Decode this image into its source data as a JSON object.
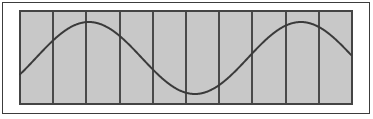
{
  "figure": {
    "background_color": "#ffffff",
    "outer_frame": {
      "name": "outer-frame",
      "x": 2.5,
      "y": 2.5,
      "width": 367,
      "height": 111,
      "stroke_color": "#3c3c3c",
      "stroke_width": 1,
      "fill": "none"
    },
    "panel": {
      "name": "plot-panel",
      "x": 20,
      "y": 11,
      "width": 332,
      "height": 93,
      "fill_color": "#c8c8c8",
      "stroke_color": "#444444",
      "stroke_width": 2
    },
    "grid": {
      "name": "vertical-gridlines",
      "orientation": "vertical",
      "count": 9,
      "columns": 10,
      "spacing": 33.2,
      "stroke_color": "#4a4a4a",
      "stroke_width": 2,
      "x_positions": [
        53.2,
        86.4,
        119.6,
        152.8,
        186.0,
        219.2,
        252.4,
        285.6,
        318.8
      ]
    },
    "curve": {
      "name": "sine-curve",
      "stroke_color": "#3a3a3a",
      "stroke_width": 2,
      "fill": "none",
      "linecap": "round",
      "linejoin": "round"
    }
  },
  "chart_data": {
    "type": "line",
    "xlabel": "",
    "ylabel": "",
    "grid": true,
    "grid_orientation": "vertical",
    "grid_lines": 9,
    "legend": "none",
    "xlim": [
      20,
      352
    ],
    "ylim": [
      11,
      104
    ],
    "axis_ticks": [],
    "series": [
      {
        "name": "sine",
        "waveform": "sine",
        "amplitude": 36,
        "centerline_y": 58,
        "period": 212,
        "phase_deg": -27,
        "x_start": 20,
        "x_end": 351,
        "peaks": [
          {
            "x": 76,
            "y": 22
          },
          {
            "x": 288,
            "y": 22
          }
        ],
        "troughs": [
          {
            "x": 182,
            "y": 94
          }
        ],
        "endpoints": [
          {
            "x": 20,
            "y": 59
          },
          {
            "x": 351,
            "y": 63
          }
        ],
        "points": [
          {
            "x": 20,
            "y": 59.1
          },
          {
            "x": 30,
            "y": 49.8
          },
          {
            "x": 40,
            "y": 41.0
          },
          {
            "x": 50,
            "y": 33.5
          },
          {
            "x": 60,
            "y": 27.5
          },
          {
            "x": 70,
            "y": 23.6
          },
          {
            "x": 76,
            "y": 22.1
          },
          {
            "x": 85,
            "y": 22.3
          },
          {
            "x": 95,
            "y": 24.9
          },
          {
            "x": 105,
            "y": 29.9
          },
          {
            "x": 115,
            "y": 36.8
          },
          {
            "x": 125,
            "y": 45.1
          },
          {
            "x": 135,
            "y": 54.1
          },
          {
            "x": 145,
            "y": 63.2
          },
          {
            "x": 155,
            "y": 71.6
          },
          {
            "x": 165,
            "y": 78.8
          },
          {
            "x": 175,
            "y": 84.2
          },
          {
            "x": 182,
            "y": 93.6
          },
          {
            "x": 190,
            "y": 92.6
          },
          {
            "x": 200,
            "y": 91.7
          },
          {
            "x": 210,
            "y": 88.6
          },
          {
            "x": 220,
            "y": 83.6
          },
          {
            "x": 230,
            "y": 76.9
          },
          {
            "x": 240,
            "y": 68.9
          },
          {
            "x": 250,
            "y": 60.0
          },
          {
            "x": 260,
            "y": 50.9
          },
          {
            "x": 270,
            "y": 42.2
          },
          {
            "x": 280,
            "y": 34.5
          },
          {
            "x": 288,
            "y": 22.4
          },
          {
            "x": 300,
            "y": 23.4
          },
          {
            "x": 310,
            "y": 25.1
          },
          {
            "x": 320,
            "y": 31.0
          },
          {
            "x": 330,
            "y": 40.0
          },
          {
            "x": 340,
            "y": 51.0
          },
          {
            "x": 351,
            "y": 63.2
          }
        ]
      }
    ]
  }
}
